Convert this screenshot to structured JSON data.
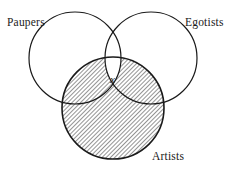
{
  "figure": {
    "type": "venn-diagram-3-set",
    "background_color": "#ffffff",
    "stroke_color": "#1a1a1a",
    "hatch_color": "#3a3a3a",
    "labels": {
      "set_left": "Paupers",
      "set_right": "Egotists",
      "set_bottom": "Artists",
      "marker": "x"
    },
    "circles": [
      {
        "name": "Paupers",
        "cx": 75,
        "cy": 58,
        "r": 46
      },
      {
        "name": "Egotists",
        "cx": 151,
        "cy": 58,
        "r": 46
      },
      {
        "name": "Artists",
        "cx": 113,
        "cy": 108,
        "r": 51
      }
    ],
    "shaded_region": "Artists minus (Paupers intersect Egotists)",
    "marker_region": "Paupers intersect Egotists intersect Artists"
  }
}
